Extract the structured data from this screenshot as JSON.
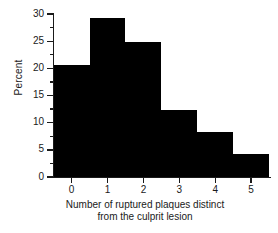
{
  "chart_data": {
    "type": "bar",
    "title": "",
    "subtitle": "",
    "xlabel_line1": "Number of ruptured plaques distinct",
    "xlabel_line2": "from the culprit lesion",
    "ylabel": "Percent",
    "categories": [
      "0",
      "1",
      "2",
      "3",
      "4",
      "5"
    ],
    "values": [
      20.7,
      29.2,
      24.8,
      12.3,
      8.3,
      4.2
    ],
    "series": [
      {
        "name": "Percent of patients",
        "values": [
          20.7,
          29.2,
          24.8,
          12.3,
          8.3,
          4.2
        ]
      }
    ],
    "xlim": [
      -0.5,
      5.5
    ],
    "ylim": [
      0,
      30
    ],
    "ytick_labels": [
      "0",
      "5",
      "10",
      "15",
      "20",
      "25",
      "30"
    ],
    "ytick_values": [
      0,
      5,
      10,
      15,
      20,
      25,
      30
    ],
    "yminor_ticks": [
      2.5,
      7.5,
      12.5,
      17.5,
      22.5,
      27.5
    ],
    "xtick_labels": [
      "0",
      "1",
      "2",
      "3",
      "4",
      "5"
    ],
    "xtick_values": [
      0,
      1,
      2,
      3,
      4,
      5
    ],
    "grid": false,
    "legend": "none",
    "bar_color": "#000000",
    "axis_color": "#1a1a1a",
    "background_color": "#ffffff",
    "bar_width": 1.0,
    "annotations": []
  }
}
